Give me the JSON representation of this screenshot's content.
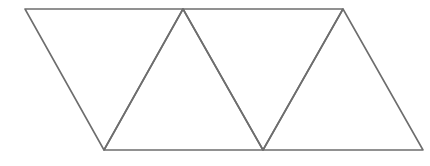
{
  "diagram": {
    "stroke_color": "#6e6e6e",
    "stroke_width": 1.6,
    "background": "#ffffff",
    "vertices": {
      "top": [
        [
          25,
          9
        ],
        [
          183,
          9
        ],
        [
          343,
          9
        ]
      ],
      "bottom": [
        [
          104,
          150
        ],
        [
          263,
          150
        ],
        [
          423,
          150
        ]
      ]
    },
    "triangles": [
      {
        "id": "t1",
        "points": [
          [
            25,
            9
          ],
          [
            183,
            9
          ],
          [
            104,
            150
          ]
        ],
        "orientation": "down"
      },
      {
        "id": "t2",
        "points": [
          [
            183,
            9
          ],
          [
            104,
            150
          ],
          [
            263,
            150
          ]
        ],
        "orientation": "up"
      },
      {
        "id": "t3",
        "points": [
          [
            183,
            9
          ],
          [
            343,
            9
          ],
          [
            263,
            150
          ]
        ],
        "orientation": "down"
      },
      {
        "id": "t4",
        "points": [
          [
            343,
            9
          ],
          [
            263,
            150
          ],
          [
            423,
            150
          ]
        ],
        "orientation": "up"
      }
    ]
  }
}
